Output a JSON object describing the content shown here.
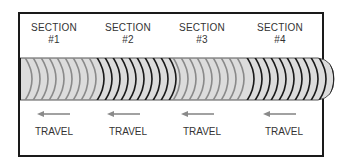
{
  "diagram": {
    "sections": [
      {
        "title": "SECTION",
        "number": "#1",
        "center_x": 54,
        "arc_color": "#8a8a8a"
      },
      {
        "title": "SECTION",
        "number": "#2",
        "center_x": 128,
        "arc_color": "#1a1a1a"
      },
      {
        "title": "SECTION",
        "number": "#3",
        "center_x": 202,
        "arc_color": "#8a8a8a"
      },
      {
        "title": "SECTION",
        "number": "#4",
        "center_x": 280,
        "arc_color": "#1a1a1a"
      }
    ],
    "travel": [
      {
        "label": "TRAVEL",
        "center_x": 54
      },
      {
        "label": "TRAVEL",
        "center_x": 128
      },
      {
        "label": "TRAVEL",
        "center_x": 202
      },
      {
        "label": "TRAVEL",
        "center_x": 280
      }
    ],
    "colors": {
      "frame": "#1a1a1a",
      "bead_fill": "#dcdcdc",
      "arrow": "#8a8a8a"
    }
  }
}
